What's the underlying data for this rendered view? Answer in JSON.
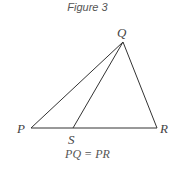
{
  "figure": {
    "title": "Figure 3",
    "caption": "PQ = PR",
    "line_color": "#333333",
    "points": {
      "P": {
        "label": "P",
        "x": 31,
        "y": 128
      },
      "Q": {
        "label": "Q",
        "x": 123,
        "y": 42
      },
      "R": {
        "label": "R",
        "x": 157,
        "y": 128
      },
      "S": {
        "label": "S",
        "x": 73,
        "y": 128
      }
    },
    "segments": [
      "PQ",
      "QR",
      "PR",
      "QS"
    ]
  }
}
